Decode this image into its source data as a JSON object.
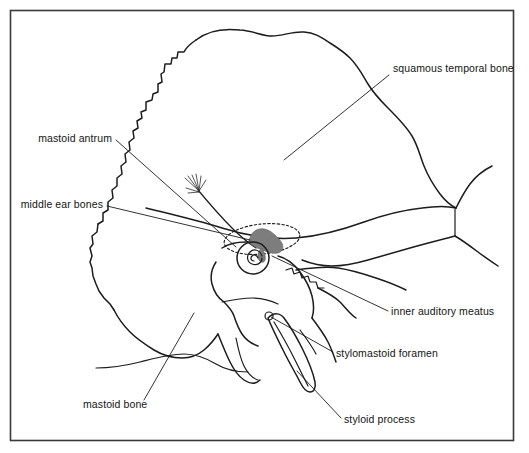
{
  "figure": {
    "background_color": "#ffffff",
    "frame_color": "#3a3a3a",
    "ink_color": "#1c1c1c",
    "ossicle_fill_color": "#7d7d7d"
  },
  "labels": [
    {
      "id": "squamous-temporal-bone",
      "text": "squamous temporal bone",
      "text_x": 393,
      "text_y": 72,
      "anchor": "start",
      "leader": "M 389 75 L 284 160"
    },
    {
      "id": "mastoid-antrum",
      "text": "mastoid antrum",
      "text_x": 112,
      "text_y": 142,
      "anchor": "end",
      "leader": "M 116 140 L 236 247"
    },
    {
      "id": "middle-ear-bones",
      "text": "middle ear bones",
      "text_x": 103,
      "text_y": 208,
      "anchor": "end",
      "leader": "M 107 206 L 250 240"
    },
    {
      "id": "inner-auditory-meatus",
      "text": "inner auditory meatus",
      "text_x": 391,
      "text_y": 315,
      "anchor": "start",
      "leader": "M 388 311 L 272 256"
    },
    {
      "id": "stylomastoid-foramen",
      "text": "stylomastoid foramen",
      "text_x": 336,
      "text_y": 357,
      "anchor": "start",
      "leader": "M 333 352 L 271 317"
    },
    {
      "id": "mastoid-bone",
      "text": "mastoid bone",
      "text_x": 83,
      "text_y": 408,
      "anchor": "start",
      "leader": "M 144 400 L 194 313"
    },
    {
      "id": "styloid-process",
      "text": "styloid process",
      "text_x": 344,
      "text_y": 423,
      "anchor": "start",
      "leader": "M 341 418 L 297 371"
    }
  ],
  "structures": [
    {
      "id": "skull-outline",
      "name": "temporal and surrounding bone outline"
    },
    {
      "id": "squamous-suture",
      "name": "squamous suture line"
    },
    {
      "id": "mastoid-air-cells",
      "name": "mastoid air cell fan"
    },
    {
      "id": "antrum-ellipse",
      "name": "mastoid antrum dotted outline"
    },
    {
      "id": "ossicles",
      "name": "middle ear ossicle mass"
    },
    {
      "id": "cochlea",
      "name": "cochlea spiral"
    },
    {
      "id": "petrous-ridge",
      "name": "petrous portion ridge"
    },
    {
      "id": "styloid-spike",
      "name": "styloid process spike"
    },
    {
      "id": "foramen-circle",
      "name": "stylomastoid foramen opening"
    },
    {
      "id": "zygomatic-arch",
      "name": "zygomatic process"
    }
  ]
}
